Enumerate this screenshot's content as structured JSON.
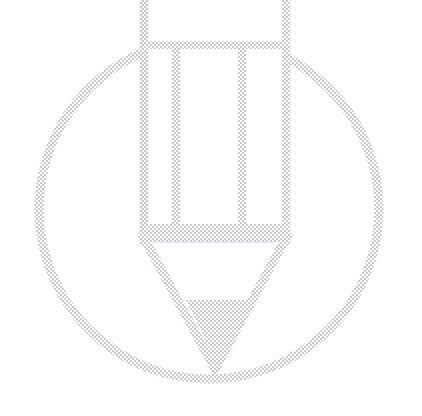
{
  "canvas": {
    "width": 422,
    "height": 416,
    "background_color": "#ffffff",
    "kind": "watermark-placeholder-graphic"
  },
  "graphic": {
    "name": "edit-pencil-in-circle-watermark",
    "title": "Edit",
    "description": "Very light grey dithered pencil-inside-a-circle outline watermark, cropped at the top edge of the canvas.",
    "style": {
      "stroke_color": "#e9e9ec",
      "stroke_color_light": "#f1f1f3",
      "fill_color": "#eeeef0",
      "stroke_width": 9,
      "rendering": "ordered-dither-halftone",
      "opacity": 1
    },
    "parts": [
      {
        "id": "circle-outline",
        "name": "circle-outline",
        "shape": "circle",
        "cx": 209,
        "cy": 209,
        "r": 170,
        "stroke_width": 9,
        "fill": "none"
      },
      {
        "id": "pencil-body",
        "name": "pencil-body",
        "shape": "rect",
        "x": 144,
        "y": -40,
        "width": 142,
        "height": 280,
        "stroke_width": 9,
        "fill": "none"
      },
      {
        "id": "pencil-ferrule-band",
        "name": "pencil-ferrule-band",
        "shape": "line",
        "x1": 144,
        "y1": 45,
        "x2": 286,
        "y2": 45,
        "stroke_width": 8
      },
      {
        "id": "pencil-inner-line-left",
        "name": "pencil-inner-line-left",
        "shape": "line",
        "x1": 176,
        "y1": 45,
        "x2": 176,
        "y2": 226,
        "stroke_width": 8
      },
      {
        "id": "pencil-inner-line-right",
        "name": "pencil-inner-line-right",
        "shape": "line",
        "x1": 242,
        "y1": 45,
        "x2": 242,
        "y2": 226,
        "stroke_width": 8
      },
      {
        "id": "pencil-collar-band",
        "name": "pencil-collar-band",
        "shape": "rect",
        "x": 144,
        "y": 224,
        "width": 142,
        "height": 16,
        "fill": "solid"
      },
      {
        "id": "pencil-tip-outline",
        "name": "pencil-tip-outline",
        "shape": "polygon",
        "points": "144,238 286,238 215,369",
        "stroke_width": 9,
        "fill": "none"
      },
      {
        "id": "pencil-graphite-point",
        "name": "pencil-graphite-point",
        "shape": "polygon",
        "points": "186,300 247,300 216,362",
        "fill": "solid"
      }
    ]
  }
}
